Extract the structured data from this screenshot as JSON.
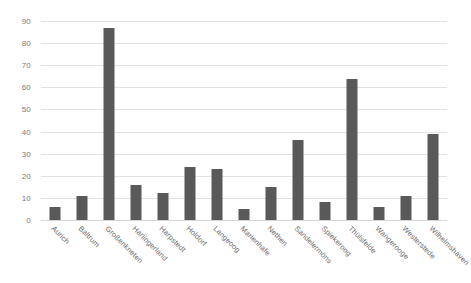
{
  "chart_data": {
    "type": "bar",
    "title": "",
    "subtitle": "",
    "xlabel": "",
    "ylabel": "",
    "ylim": [
      0,
      90
    ],
    "ytick_step": 10,
    "yticks": [
      0,
      10,
      20,
      30,
      40,
      50,
      60,
      70,
      80,
      90
    ],
    "grid": true,
    "legend": false,
    "legend_position": "none",
    "bar_color": "#595959",
    "gridline_color": "#e2e2e2",
    "tick_label_color": "#7a7a7a",
    "categories": [
      "Aurich",
      "Baltrum",
      "Großenkneten",
      "Harlingerland",
      "Harpstedt",
      "Holdorf",
      "Langeoog",
      "Marienhafe",
      "Nethen",
      "Sandelermöns",
      "Spiekeroog",
      "Thülsfelde",
      "Wangerooge",
      "Westerstede",
      "Wilhelmshaven"
    ],
    "values": [
      6,
      11,
      87,
      16,
      12,
      24,
      23,
      5,
      15,
      36,
      8,
      64,
      6,
      11,
      39
    ],
    "series": [
      {
        "name": "",
        "values": [
          6,
          11,
          87,
          16,
          12,
          24,
          23,
          5,
          15,
          36,
          8,
          64,
          6,
          11,
          39
        ]
      }
    ]
  }
}
